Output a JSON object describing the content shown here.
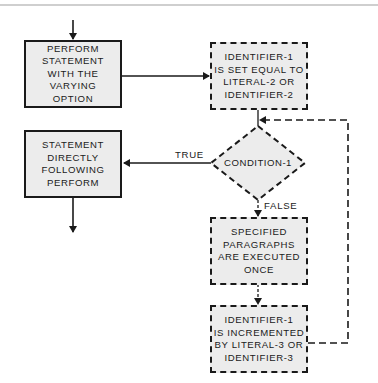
{
  "diagram": {
    "type": "flowchart",
    "title": "",
    "nodes": {
      "perform": {
        "shape": "rectangle-solid",
        "lines": [
          "PERFORM",
          "STATEMENT",
          "WITH THE",
          "VARYING",
          "OPTION"
        ]
      },
      "set_identifier": {
        "shape": "rectangle-dashed",
        "lines": [
          "IDENTIFIER-1",
          "IS SET EQUAL TO",
          "LITERAL-2 OR",
          "IDENTIFIER-2"
        ]
      },
      "condition": {
        "shape": "diamond-dashed",
        "label": "CONDITION-1"
      },
      "next_statement": {
        "shape": "rectangle-solid",
        "lines": [
          "STATEMENT",
          "DIRECTLY",
          "FOLLOWING",
          "PERFORM"
        ]
      },
      "execute_paragraphs": {
        "shape": "rectangle-dashed",
        "lines": [
          "SPECIFIED",
          "PARAGRAPHS",
          "ARE EXECUTED",
          "ONCE"
        ]
      },
      "increment": {
        "shape": "rectangle-dashed",
        "lines": [
          "IDENTIFIER-1",
          "IS INCREMENTED",
          "BY LITERAL-3 OR",
          "IDENTIFIER-3"
        ]
      }
    },
    "edges": [
      {
        "from": "entry",
        "to": "perform",
        "style": "solid"
      },
      {
        "from": "perform",
        "to": "set_identifier",
        "style": "solid"
      },
      {
        "from": "set_identifier",
        "to": "condition",
        "style": "solid"
      },
      {
        "from": "condition",
        "to": "next_statement",
        "label": "TRUE",
        "style": "solid"
      },
      {
        "from": "condition",
        "to": "execute_paragraphs",
        "label": "FALSE",
        "style": "dashed"
      },
      {
        "from": "execute_paragraphs",
        "to": "increment",
        "style": "dashed"
      },
      {
        "from": "increment",
        "to": "condition",
        "style": "dashed",
        "note": "loop back"
      },
      {
        "from": "next_statement",
        "to": "exit",
        "style": "solid"
      }
    ],
    "edge_labels": {
      "true": "TRUE",
      "false": "FALSE"
    },
    "colors": {
      "box_fill": "#ececec",
      "stroke": "#1a1a1a",
      "background": "#ffffff"
    }
  }
}
